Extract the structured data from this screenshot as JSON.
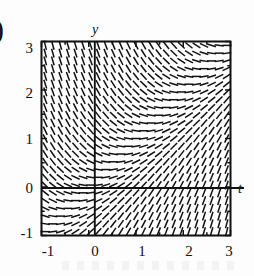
{
  "figure": {
    "fragment_marker": ")",
    "background_color": "#fdfdfd",
    "ink_color": "#111111"
  },
  "chart_data": {
    "type": "line",
    "title": "",
    "subtitle": "",
    "xlabel": "t",
    "ylabel": "y",
    "xlim": [
      -1,
      3
    ],
    "ylim": [
      -1,
      3
    ],
    "xticks": [
      -1,
      0,
      1,
      2,
      3
    ],
    "yticks": [
      -1,
      0,
      1,
      2,
      3
    ],
    "xtick_labels": [
      "-1",
      "0",
      "1",
      "2",
      "3"
    ],
    "ytick_labels": [
      "-1",
      "0",
      "1",
      "2",
      "3"
    ],
    "grid": false,
    "legend": "none",
    "plot_kind": "slope-field",
    "equation": "dy/dt = t - y",
    "segment_grid": {
      "nx": 25,
      "ny": 25,
      "x_start": -1,
      "x_end": 3,
      "y_start": -1,
      "y_end": 3
    },
    "sampled_slopes": [
      {
        "t": -1,
        "y": 3,
        "slope": -4
      },
      {
        "t": -1,
        "y": 2,
        "slope": -3
      },
      {
        "t": -1,
        "y": 1,
        "slope": -2
      },
      {
        "t": -1,
        "y": 0,
        "slope": -1
      },
      {
        "t": -1,
        "y": -1,
        "slope": 0
      },
      {
        "t": 0,
        "y": 3,
        "slope": -3
      },
      {
        "t": 0,
        "y": 2,
        "slope": -2
      },
      {
        "t": 0,
        "y": 1,
        "slope": -1
      },
      {
        "t": 0,
        "y": 0,
        "slope": 0
      },
      {
        "t": 0,
        "y": -1,
        "slope": 1
      },
      {
        "t": 1,
        "y": 3,
        "slope": -2
      },
      {
        "t": 1,
        "y": 2,
        "slope": -1
      },
      {
        "t": 1,
        "y": 1,
        "slope": 0
      },
      {
        "t": 1,
        "y": 0,
        "slope": 1
      },
      {
        "t": 1,
        "y": -1,
        "slope": 2
      },
      {
        "t": 2,
        "y": 3,
        "slope": -1
      },
      {
        "t": 2,
        "y": 2,
        "slope": 0
      },
      {
        "t": 2,
        "y": 1,
        "slope": 1
      },
      {
        "t": 2,
        "y": 0,
        "slope": 2
      },
      {
        "t": 2,
        "y": -1,
        "slope": 3
      },
      {
        "t": 3,
        "y": 3,
        "slope": 0
      },
      {
        "t": 3,
        "y": 2,
        "slope": 1
      },
      {
        "t": 3,
        "y": 1,
        "slope": 2
      },
      {
        "t": 3,
        "y": 0,
        "slope": 3
      },
      {
        "t": 3,
        "y": -1,
        "slope": 4
      }
    ]
  },
  "axes_labels": {
    "vertical_axis_name": "y",
    "horizontal_axis_name": "t"
  }
}
